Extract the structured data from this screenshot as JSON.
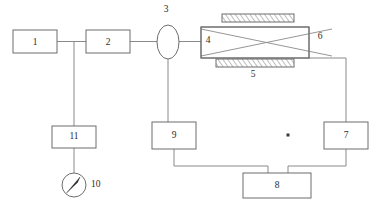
{
  "diagram": {
    "type": "process-flow-schematic",
    "background_color": "#ffffff",
    "line_color": "#8a8a8a",
    "box_stroke_color": "#6d6d6d",
    "label_color": "#2b2b2b",
    "components": [
      {
        "id": "1",
        "label": "1",
        "shape": "rectangle",
        "x": 13,
        "y": 30,
        "w": 44,
        "h": 23
      },
      {
        "id": "2",
        "label": "2",
        "shape": "rectangle",
        "x": 86,
        "y": 30,
        "w": 44,
        "h": 23
      },
      {
        "id": "3",
        "label": "3",
        "shape": "ellipse",
        "cx": 168,
        "cy": 42,
        "rx": 11,
        "ry": 17
      },
      {
        "id": "4",
        "label": "4",
        "shape": "reactor-rect",
        "x": 201,
        "y": 27,
        "w": 108,
        "h": 31
      },
      {
        "id": "5",
        "label": "5",
        "shape": "hatched-plate-lower",
        "x": 216,
        "y": 59,
        "w": 78,
        "h": 8
      },
      {
        "id": "6",
        "label": "6",
        "shape": "crossed-coil-callout"
      },
      {
        "id": "7",
        "label": "7",
        "shape": "rectangle",
        "x": 324,
        "y": 122,
        "w": 44,
        "h": 27
      },
      {
        "id": "8",
        "label": "8",
        "shape": "rectangle",
        "x": 243,
        "y": 173,
        "w": 68,
        "h": 25
      },
      {
        "id": "9",
        "label": "9",
        "shape": "rectangle",
        "x": 152,
        "y": 122,
        "w": 44,
        "h": 27
      },
      {
        "id": "10",
        "label": "10",
        "shape": "gauge-circle",
        "cx": 74,
        "cy": 185,
        "r": 12
      },
      {
        "id": "11",
        "label": "11",
        "shape": "rectangle",
        "x": 52,
        "y": 126,
        "w": 44,
        "h": 22
      },
      {
        "id": "top_plate",
        "label": "",
        "shape": "hatched-plate-upper",
        "x": 222,
        "y": 14,
        "w": 72,
        "h": 8
      }
    ],
    "labels": {
      "one": "1",
      "two": "2",
      "three": "3",
      "four": "4",
      "five": "5",
      "six": "6",
      "seven": "7",
      "eight": "8",
      "nine": "9",
      "ten": "10",
      "eleven": "11"
    },
    "marker": {
      "name": "reference-dot",
      "x": 288,
      "y": 135
    }
  }
}
